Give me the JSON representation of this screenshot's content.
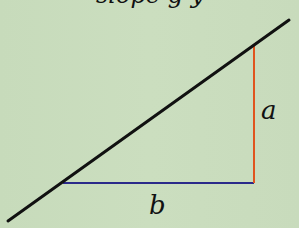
{
  "diagram": {
    "title_partial": "slope g  y",
    "background_color": "#c9dcbd",
    "line": {
      "color": "#111111",
      "x1": 8,
      "y1": 221,
      "x2": 289,
      "y2": 20
    },
    "rise": {
      "label": "a",
      "color": "#e0541e",
      "x1": 254,
      "y1": 44,
      "x2": 254,
      "y2": 183
    },
    "run": {
      "label": "b",
      "color": "#2a2a8a",
      "x1": 63,
      "y1": 183,
      "x2": 254,
      "y2": 183
    }
  }
}
